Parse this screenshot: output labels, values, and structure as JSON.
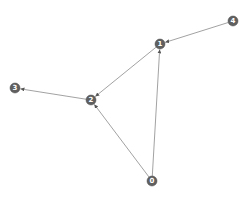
{
  "diagram": {
    "type": "directed-graph",
    "node_color": "#606060",
    "edge_color": "#8a8a8a",
    "label_color": "#ffffff",
    "node_radius": 5,
    "nodes": [
      {
        "id": "0",
        "label": "0",
        "x": 152,
        "y": 181
      },
      {
        "id": "1",
        "label": "1",
        "x": 160,
        "y": 44
      },
      {
        "id": "2",
        "label": "2",
        "x": 91,
        "y": 100
      },
      {
        "id": "3",
        "label": "3",
        "x": 15,
        "y": 88
      },
      {
        "id": "4",
        "label": "4",
        "x": 233,
        "y": 21
      }
    ],
    "edges": [
      {
        "source": "0",
        "target": "1"
      },
      {
        "source": "0",
        "target": "2"
      },
      {
        "source": "1",
        "target": "2"
      },
      {
        "source": "2",
        "target": "3"
      },
      {
        "source": "4",
        "target": "1"
      }
    ]
  }
}
